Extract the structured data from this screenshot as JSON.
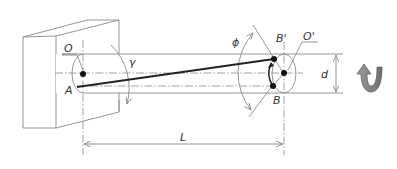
{
  "diagram": {
    "type": "torsion-shaft-schematic",
    "labels": {
      "fixed_center": "O",
      "free_center": "O'",
      "point_a": "A",
      "point_b": "B",
      "point_b_prime": "B'",
      "shear_angle": "γ",
      "twist_angle": "ϕ",
      "length": "L",
      "diameter": "d"
    },
    "icons": {
      "rotation": "curved-rotation-arrow"
    },
    "colors": {
      "line": "#8a8a8a",
      "bold_line": "#222222",
      "arrow_fill": "#7a7a7a",
      "background": "#ffffff"
    }
  }
}
